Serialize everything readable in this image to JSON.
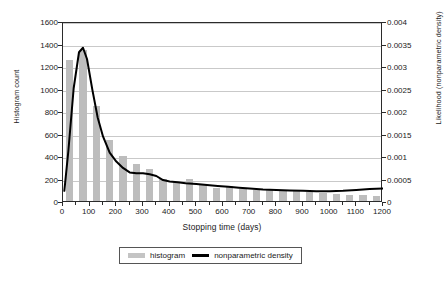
{
  "chart_data": {
    "type": "bar",
    "title": "",
    "xlabel": "Stopping time (days)",
    "ylabel": "Histogram count",
    "y2label": "Likelihood (nonparametric density)",
    "xlim": [
      0,
      1200
    ],
    "ylim": [
      0,
      1600
    ],
    "y2lim": [
      0,
      0.004
    ],
    "grid": true,
    "legend_position": "bottom",
    "xticks": [
      0,
      100,
      200,
      300,
      400,
      500,
      600,
      700,
      800,
      900,
      1000,
      1100,
      1200
    ],
    "xtick_labels": [
      "0",
      "100",
      "200",
      "300",
      "400",
      "500",
      "600",
      "700",
      "800",
      "900",
      "1000",
      "1100",
      "1200"
    ],
    "yticks": [
      0,
      200,
      400,
      600,
      800,
      1000,
      1200,
      1400,
      1600
    ],
    "ytick_labels": [
      "0",
      "200",
      "400",
      "600",
      "800",
      "1000",
      "1200",
      "1400",
      "1600"
    ],
    "y2ticks": [
      0,
      0.0005,
      0.001,
      0.0015,
      0.002,
      0.0025,
      0.003,
      0.0035,
      0.004
    ],
    "y2tick_labels": [
      "0",
      "0.0005",
      "0.001",
      "0.0015",
      "0.002",
      "0.0025",
      "0.003",
      "0.0035",
      "0.004"
    ],
    "bin_width": 50,
    "series": [
      {
        "name": "histogram",
        "type": "bar",
        "axis": "left",
        "color": "#bdbdbd",
        "bin_centers": [
          25,
          75,
          125,
          175,
          225,
          275,
          325,
          375,
          425,
          475,
          525,
          575,
          625,
          675,
          725,
          775,
          825,
          875,
          925,
          975,
          1025,
          1075,
          1125,
          1175
        ],
        "values": [
          1250,
          1340,
          845,
          540,
          400,
          330,
          285,
          200,
          175,
          200,
          140,
          120,
          130,
          110,
          100,
          95,
          90,
          85,
          80,
          70,
          65,
          55,
          50,
          45
        ]
      },
      {
        "name": "nonparametric density",
        "type": "line",
        "axis": "right",
        "color": "#000000",
        "x": [
          5,
          20,
          40,
          60,
          75,
          90,
          110,
          130,
          150,
          175,
          200,
          225,
          250,
          275,
          300,
          325,
          350,
          375,
          400,
          430,
          460,
          500,
          540,
          580,
          620,
          660,
          700,
          750,
          800,
          850,
          900,
          950,
          1000,
          1050,
          1100,
          1150,
          1200
        ],
        "values": [
          0.00027,
          0.00115,
          0.00255,
          0.00335,
          0.00345,
          0.0032,
          0.00252,
          0.0019,
          0.00148,
          0.00112,
          0.00092,
          0.00078,
          0.00068,
          0.00066,
          0.00066,
          0.00064,
          0.0006,
          0.00051,
          0.00048,
          0.00046,
          0.00044,
          0.00042,
          0.0004,
          0.00038,
          0.00036,
          0.00034,
          0.00032,
          0.0003,
          0.00029,
          0.00028,
          0.00027,
          0.00026,
          0.00026,
          0.00027,
          0.00029,
          0.00031,
          0.00032
        ]
      }
    ]
  },
  "legend": {
    "items": [
      {
        "label": "histogram",
        "marker": "bar-swatch"
      },
      {
        "label": "nonparametric density",
        "marker": "line-swatch"
      }
    ]
  }
}
